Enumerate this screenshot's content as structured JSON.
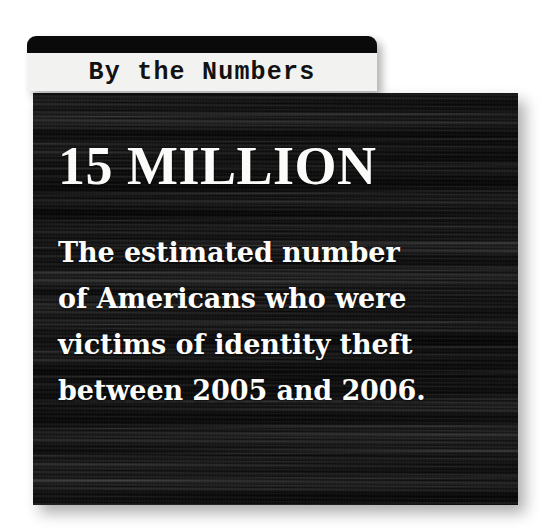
{
  "card": {
    "header": {
      "title": "By the Numbers"
    },
    "statistic": {
      "headline": "15 MILLION",
      "body_lines": [
        "The estimated number",
        "of Americans who were",
        "victims of identity theft",
        "between 2005 and 2006."
      ],
      "full_body": "The estimated number of Americans who were victims of identity theft between 2005 and 2006."
    }
  },
  "colors": {
    "page_background": "#ffffff",
    "header_bar": "#0a0a0a",
    "header_label_background": "#f2f2f0",
    "header_title_text": "#121212",
    "panel_background": "#141414",
    "panel_text": "#fdfdfc"
  }
}
